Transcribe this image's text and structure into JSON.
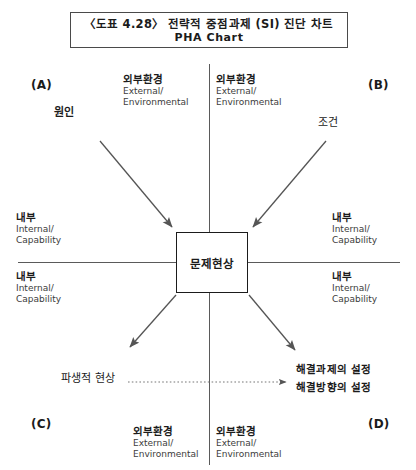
{
  "title": {
    "line1": "〈도표 4.28〉 전략적 중점과제 (SI) 진단 차트",
    "line2": "PHA Chart"
  },
  "center": {
    "label": "문제현상"
  },
  "corners": {
    "a": "(A)",
    "b": "(B)",
    "c": "(C)",
    "d": "(D)"
  },
  "axis_labels": {
    "top_left": {
      "ko": "외부환경",
      "en1": "External/",
      "en2": "Environmental"
    },
    "top_right": {
      "ko": "외부환경",
      "en1": "External/",
      "en2": "Environmental"
    },
    "left_upper": {
      "ko": "내부",
      "en1": "Internal/",
      "en2": "Capability"
    },
    "left_lower": {
      "ko": "내부",
      "en1": "Internal/",
      "en2": "Capability"
    },
    "right_upper": {
      "ko": "내부",
      "en1": "Internal/",
      "en2": "Capability"
    },
    "right_lower": {
      "ko": "내부",
      "en1": "Internal/",
      "en2": "Capability"
    },
    "bottom_left": {
      "ko": "외부환경",
      "en1": "External/",
      "en2": "Environmental"
    },
    "bottom_right": {
      "ko": "외부환경",
      "en1": "External/",
      "en2": "Environmental"
    }
  },
  "nodes": {
    "cause": "원인",
    "condition": "조건",
    "derived": "파생적 현상",
    "outcome1": "해결과제의 설정",
    "outcome2": "해결방향의 설정"
  },
  "colors": {
    "line": "#5a5a5a",
    "arrow": "#555555",
    "box_border": "#1b1b1b",
    "text": "#1b1b1b",
    "text_secondary": "#3c3c3c",
    "background": "#ffffff"
  }
}
